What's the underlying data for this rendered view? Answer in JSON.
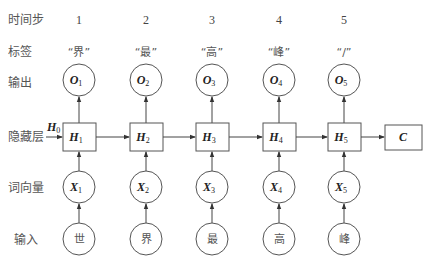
{
  "row_labels": {
    "timestep": "时间步",
    "label": "标签",
    "output": "输出",
    "hidden": "隐藏层",
    "embedding": "词向量",
    "input": "输入"
  },
  "columns": [
    {
      "step": "1",
      "tag": "“界”",
      "output": {
        "base": "O",
        "sub": "1"
      },
      "hidden": {
        "base": "H",
        "sub": "1"
      },
      "embedding": {
        "base": "X",
        "sub": "1"
      },
      "input": "世"
    },
    {
      "step": "2",
      "tag": "“最”",
      "output": {
        "base": "O",
        "sub": "2"
      },
      "hidden": {
        "base": "H",
        "sub": "2"
      },
      "embedding": {
        "base": "X",
        "sub": "2"
      },
      "input": "界"
    },
    {
      "step": "3",
      "tag": "“高”",
      "output": {
        "base": "O",
        "sub": "3"
      },
      "hidden": {
        "base": "H",
        "sub": "3"
      },
      "embedding": {
        "base": "X",
        "sub": "3"
      },
      "input": "最"
    },
    {
      "step": "4",
      "tag": "“峰”",
      "output": {
        "base": "O",
        "sub": "4"
      },
      "hidden": {
        "base": "H",
        "sub": "4"
      },
      "embedding": {
        "base": "X",
        "sub": "4"
      },
      "input": "高"
    },
    {
      "step": "5",
      "tag": "“/”",
      "output": {
        "base": "O",
        "sub": "5"
      },
      "hidden": {
        "base": "H",
        "sub": "5"
      },
      "embedding": {
        "base": "X",
        "sub": "5"
      },
      "input": "峰"
    }
  ],
  "initial_hidden": {
    "base": "H",
    "sub": "0"
  },
  "final_state": "C"
}
